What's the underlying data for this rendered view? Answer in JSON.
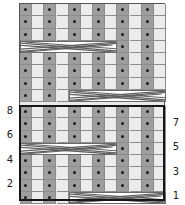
{
  "chart": {
    "columns": 12,
    "rows": 16,
    "cell_width": 12.1667,
    "cell_height": 12.25,
    "grid": {
      "x": 19,
      "y": 3,
      "width": 146,
      "height": 198
    },
    "colors": {
      "purl_cell": "#9e9e9e",
      "knit_cell": "#ececec",
      "blank_cell": "#e9e9e9",
      "cable_fill": "#ffffff",
      "cable_line": "#6a6a6a",
      "grid_line": "#8c8c8c",
      "border": "#555555",
      "repeat_border": "#161616",
      "dot": "#1b1b1b",
      "label_text": "#1a1a1a",
      "background": "#ffffff"
    },
    "repeat_box": {
      "x": 19,
      "y": 105,
      "width": 146,
      "height": 96,
      "rows": 8
    },
    "row_labels_left": [
      {
        "text": "8",
        "x": 4,
        "y": 106
      },
      {
        "text": "6",
        "x": 4,
        "y": 130
      },
      {
        "text": "4",
        "x": 4,
        "y": 155
      },
      {
        "text": "2",
        "x": 4,
        "y": 179
      }
    ],
    "row_labels_right": [
      {
        "text": "7",
        "x": 170,
        "y": 118
      },
      {
        "text": "5",
        "x": 170,
        "y": 142
      },
      {
        "text": "3",
        "x": 170,
        "y": 167
      },
      {
        "text": "1",
        "x": 170,
        "y": 191
      }
    ],
    "legend_note": "",
    "rows_data": [
      {
        "index": 16,
        "top": 3,
        "type": "stitch",
        "cells": [
          "purl",
          "knit",
          "purl",
          "knit",
          "purl",
          "knit",
          "purl",
          "knit",
          "purl",
          "knit",
          "purl",
          "knit"
        ]
      },
      {
        "index": 15,
        "top": 15.25,
        "type": "stitch",
        "cells": [
          "purl",
          "knit",
          "purl",
          "knit",
          "purl",
          "knit",
          "purl",
          "knit",
          "purl",
          "knit",
          "purl",
          "knit"
        ]
      },
      {
        "index": 14,
        "top": 27.5,
        "type": "stitch",
        "cells": [
          "purl",
          "knit",
          "purl",
          "knit",
          "purl",
          "knit",
          "purl",
          "knit",
          "purl",
          "knit",
          "purl",
          "knit"
        ]
      },
      {
        "index": 13,
        "top": 39.75,
        "type": "cable",
        "cable_start": 0,
        "cable_span": 8,
        "cells": [
          "cable",
          "cable",
          "cable",
          "cable",
          "cable",
          "cable",
          "cable",
          "cable",
          "purl",
          "knit",
          "purl",
          "knit"
        ]
      },
      {
        "index": 12,
        "top": 52,
        "type": "stitch",
        "cells": [
          "purl",
          "knit",
          "purl",
          "knit",
          "purl",
          "knit",
          "purl",
          "knit",
          "purl",
          "knit",
          "purl",
          "knit"
        ]
      },
      {
        "index": 11,
        "top": 64.25,
        "type": "stitch",
        "cells": [
          "purl",
          "knit",
          "purl",
          "knit",
          "purl",
          "knit",
          "purl",
          "knit",
          "purl",
          "knit",
          "purl",
          "knit"
        ]
      },
      {
        "index": 10,
        "top": 76.5,
        "type": "stitch",
        "cells": [
          "purl",
          "knit",
          "purl",
          "knit",
          "purl",
          "knit",
          "purl",
          "knit",
          "purl",
          "knit",
          "purl",
          "knit"
        ]
      },
      {
        "index": 9,
        "top": 88.75,
        "type": "cable",
        "cable_start": 4,
        "cable_span": 8,
        "cells": [
          "purl",
          "knit",
          "purl",
          "knit",
          "cable",
          "cable",
          "cable",
          "cable",
          "cable",
          "cable",
          "cable",
          "cable"
        ]
      },
      {
        "index": 8,
        "top": 105,
        "type": "stitch",
        "cells": [
          "purl",
          "knit",
          "purl",
          "knit",
          "purl",
          "knit",
          "purl",
          "knit",
          "purl",
          "knit",
          "purl",
          "knit"
        ]
      },
      {
        "index": 7,
        "top": 117.25,
        "type": "stitch",
        "cells": [
          "purl",
          "knit",
          "purl",
          "knit",
          "purl",
          "knit",
          "purl",
          "knit",
          "purl",
          "knit",
          "purl",
          "knit"
        ]
      },
      {
        "index": 6,
        "top": 129.5,
        "type": "stitch",
        "cells": [
          "purl",
          "knit",
          "purl",
          "knit",
          "purl",
          "knit",
          "purl",
          "knit",
          "purl",
          "knit",
          "purl",
          "knit"
        ]
      },
      {
        "index": 5,
        "top": 141.75,
        "type": "cable",
        "cable_start": 0,
        "cable_span": 8,
        "cells": [
          "cable",
          "cable",
          "cable",
          "cable",
          "cable",
          "cable",
          "cable",
          "cable",
          "purl",
          "knit",
          "purl",
          "knit"
        ]
      },
      {
        "index": 4,
        "top": 154,
        "type": "stitch",
        "cells": [
          "purl",
          "knit",
          "purl",
          "knit",
          "purl",
          "knit",
          "purl",
          "knit",
          "purl",
          "knit",
          "purl",
          "knit"
        ]
      },
      {
        "index": 3,
        "top": 166.25,
        "type": "stitch",
        "cells": [
          "purl",
          "knit",
          "purl",
          "knit",
          "purl",
          "knit",
          "purl",
          "knit",
          "purl",
          "knit",
          "purl",
          "knit"
        ]
      },
      {
        "index": 2,
        "top": 178.5,
        "type": "stitch",
        "cells": [
          "purl",
          "knit",
          "purl",
          "knit",
          "purl",
          "knit",
          "purl",
          "knit",
          "purl",
          "knit",
          "purl",
          "knit"
        ]
      },
      {
        "index": 1,
        "top": 190.75,
        "type": "cable",
        "cable_start": 4,
        "cable_span": 8,
        "cells": [
          "purl",
          "knit",
          "purl",
          "knit",
          "cable",
          "cable",
          "cable",
          "cable",
          "cable",
          "cable",
          "cable",
          "cable"
        ]
      }
    ]
  }
}
